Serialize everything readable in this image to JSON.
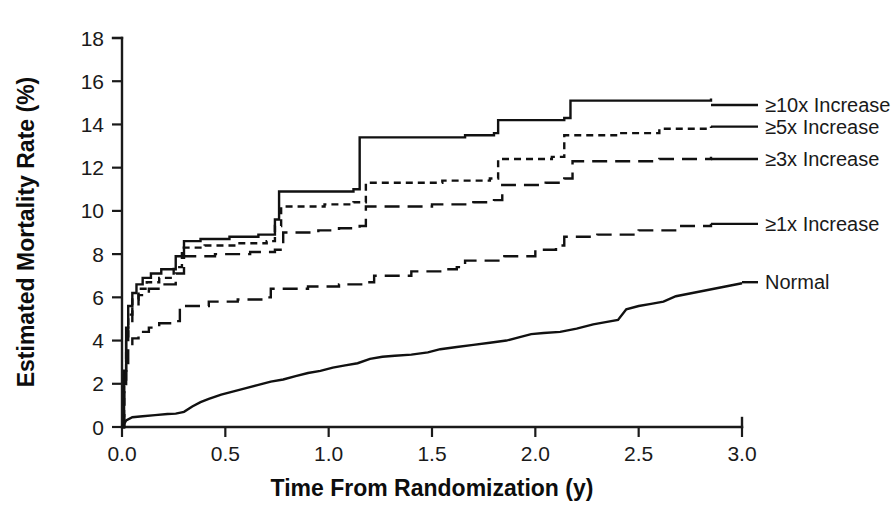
{
  "chart_data": {
    "type": "line",
    "title": "",
    "xlabel": "Time From Randomization (y)",
    "ylabel": "Estimated Mortality Rate (%)",
    "xlim": [
      0.0,
      3.0
    ],
    "ylim": [
      0,
      18
    ],
    "xticks": [
      "0.0",
      "0.5",
      "1.0",
      "1.5",
      "2.0",
      "2.5",
      "3.0"
    ],
    "xtick_values": [
      0.0,
      0.5,
      1.0,
      1.5,
      2.0,
      2.5,
      3.0
    ],
    "yticks": [
      "0",
      "2",
      "4",
      "6",
      "8",
      "10",
      "12",
      "14",
      "16",
      "18"
    ],
    "ytick_values": [
      0,
      2,
      4,
      6,
      8,
      10,
      12,
      14,
      16,
      18
    ],
    "grid": false,
    "legend_position": "right",
    "curve_style": "step-post",
    "series": [
      {
        "name": "≥10x Increase",
        "dash": "none",
        "label_y": 14.9,
        "points": [
          [
            0.0,
            0.0
          ],
          [
            0.01,
            2.6
          ],
          [
            0.02,
            4.6
          ],
          [
            0.03,
            5.6
          ],
          [
            0.05,
            6.2
          ],
          [
            0.07,
            6.6
          ],
          [
            0.1,
            6.9
          ],
          [
            0.14,
            7.1
          ],
          [
            0.19,
            7.3
          ],
          [
            0.26,
            7.9
          ],
          [
            0.3,
            8.6
          ],
          [
            0.38,
            8.7
          ],
          [
            0.52,
            8.8
          ],
          [
            0.66,
            8.9
          ],
          [
            0.74,
            9.6
          ],
          [
            0.76,
            10.9
          ],
          [
            1.12,
            11.0
          ],
          [
            1.15,
            13.4
          ],
          [
            1.66,
            13.5
          ],
          [
            1.8,
            13.6
          ],
          [
            1.82,
            14.2
          ],
          [
            2.14,
            14.3
          ],
          [
            2.17,
            15.1
          ],
          [
            2.85,
            15.2
          ]
        ]
      },
      {
        "name": "≥5x Increase",
        "dash": "short",
        "label_y": 13.9,
        "points": [
          [
            0.0,
            0.0
          ],
          [
            0.01,
            2.4
          ],
          [
            0.02,
            4.2
          ],
          [
            0.03,
            5.2
          ],
          [
            0.05,
            5.9
          ],
          [
            0.08,
            6.4
          ],
          [
            0.12,
            6.7
          ],
          [
            0.18,
            6.9
          ],
          [
            0.25,
            7.4
          ],
          [
            0.29,
            8.3
          ],
          [
            0.4,
            8.4
          ],
          [
            0.55,
            8.5
          ],
          [
            0.7,
            8.6
          ],
          [
            0.74,
            9.3
          ],
          [
            0.77,
            10.2
          ],
          [
            0.98,
            10.3
          ],
          [
            1.12,
            10.4
          ],
          [
            1.18,
            11.3
          ],
          [
            1.55,
            11.4
          ],
          [
            1.78,
            11.5
          ],
          [
            1.82,
            12.4
          ],
          [
            2.08,
            12.5
          ],
          [
            2.14,
            13.5
          ],
          [
            2.4,
            13.6
          ],
          [
            2.6,
            13.8
          ],
          [
            2.85,
            13.9
          ]
        ]
      },
      {
        "name": "≥3x Increase",
        "dash": "long",
        "label_y": 12.4,
        "points": [
          [
            0.0,
            0.0
          ],
          [
            0.01,
            2.2
          ],
          [
            0.02,
            3.9
          ],
          [
            0.03,
            4.9
          ],
          [
            0.05,
            5.6
          ],
          [
            0.08,
            6.1
          ],
          [
            0.13,
            6.4
          ],
          [
            0.2,
            6.6
          ],
          [
            0.26,
            7.1
          ],
          [
            0.3,
            7.9
          ],
          [
            0.45,
            8.0
          ],
          [
            0.62,
            8.1
          ],
          [
            0.74,
            8.2
          ],
          [
            0.78,
            9.0
          ],
          [
            0.95,
            9.1
          ],
          [
            1.05,
            9.2
          ],
          [
            1.15,
            9.3
          ],
          [
            1.18,
            10.2
          ],
          [
            1.5,
            10.3
          ],
          [
            1.7,
            10.4
          ],
          [
            1.8,
            10.5
          ],
          [
            1.84,
            11.2
          ],
          [
            2.05,
            11.3
          ],
          [
            2.14,
            11.5
          ],
          [
            2.18,
            12.3
          ],
          [
            2.6,
            12.4
          ],
          [
            2.85,
            12.5
          ]
        ]
      },
      {
        "name": "≥1x Increase",
        "dash": "long",
        "label_y": 9.4,
        "points": [
          [
            0.0,
            0.0
          ],
          [
            0.01,
            1.6
          ],
          [
            0.02,
            2.9
          ],
          [
            0.03,
            3.6
          ],
          [
            0.05,
            4.1
          ],
          [
            0.08,
            4.4
          ],
          [
            0.13,
            4.6
          ],
          [
            0.18,
            4.8
          ],
          [
            0.24,
            4.9
          ],
          [
            0.28,
            5.6
          ],
          [
            0.42,
            5.8
          ],
          [
            0.56,
            5.9
          ],
          [
            0.68,
            6.0
          ],
          [
            0.72,
            6.4
          ],
          [
            0.9,
            6.5
          ],
          [
            1.05,
            6.6
          ],
          [
            1.18,
            6.7
          ],
          [
            1.22,
            7.0
          ],
          [
            1.4,
            7.2
          ],
          [
            1.55,
            7.3
          ],
          [
            1.62,
            7.4
          ],
          [
            1.66,
            7.7
          ],
          [
            1.85,
            7.9
          ],
          [
            2.0,
            8.2
          ],
          [
            2.1,
            8.4
          ],
          [
            2.14,
            8.8
          ],
          [
            2.3,
            8.9
          ],
          [
            2.5,
            9.1
          ],
          [
            2.7,
            9.3
          ],
          [
            2.85,
            9.4
          ]
        ]
      },
      {
        "name": "Normal",
        "dash": "solid",
        "label_y": 6.7,
        "points": [
          [
            0.0,
            0.0
          ],
          [
            0.02,
            0.3
          ],
          [
            0.05,
            0.45
          ],
          [
            0.1,
            0.5
          ],
          [
            0.16,
            0.55
          ],
          [
            0.22,
            0.6
          ],
          [
            0.26,
            0.62
          ],
          [
            0.3,
            0.7
          ],
          [
            0.34,
            0.95
          ],
          [
            0.38,
            1.15
          ],
          [
            0.42,
            1.3
          ],
          [
            0.48,
            1.5
          ],
          [
            0.54,
            1.65
          ],
          [
            0.6,
            1.8
          ],
          [
            0.66,
            1.95
          ],
          [
            0.72,
            2.1
          ],
          [
            0.78,
            2.2
          ],
          [
            0.84,
            2.35
          ],
          [
            0.9,
            2.5
          ],
          [
            0.96,
            2.6
          ],
          [
            1.02,
            2.75
          ],
          [
            1.08,
            2.85
          ],
          [
            1.14,
            2.95
          ],
          [
            1.2,
            3.15
          ],
          [
            1.26,
            3.25
          ],
          [
            1.32,
            3.3
          ],
          [
            1.4,
            3.35
          ],
          [
            1.48,
            3.45
          ],
          [
            1.54,
            3.6
          ],
          [
            1.62,
            3.7
          ],
          [
            1.7,
            3.8
          ],
          [
            1.78,
            3.9
          ],
          [
            1.86,
            4.0
          ],
          [
            1.92,
            4.15
          ],
          [
            1.98,
            4.3
          ],
          [
            2.04,
            4.35
          ],
          [
            2.12,
            4.4
          ],
          [
            2.2,
            4.55
          ],
          [
            2.28,
            4.75
          ],
          [
            2.34,
            4.85
          ],
          [
            2.4,
            4.95
          ],
          [
            2.44,
            5.45
          ],
          [
            2.5,
            5.6
          ],
          [
            2.56,
            5.7
          ],
          [
            2.62,
            5.8
          ],
          [
            2.68,
            6.05
          ],
          [
            2.76,
            6.2
          ],
          [
            2.84,
            6.35
          ],
          [
            2.92,
            6.5
          ],
          [
            3.0,
            6.65
          ]
        ]
      }
    ]
  },
  "legend": {
    "items": [
      {
        "label": "≥10x Increase",
        "dash": "none"
      },
      {
        "label": "≥5x Increase",
        "dash": "short"
      },
      {
        "label": "≥3x Increase",
        "dash": "long"
      },
      {
        "label": "≥1x Increase",
        "dash": "long"
      },
      {
        "label": "Normal",
        "dash": "solid"
      }
    ]
  },
  "colors": {
    "ink": "#111111",
    "background": "#ffffff"
  }
}
